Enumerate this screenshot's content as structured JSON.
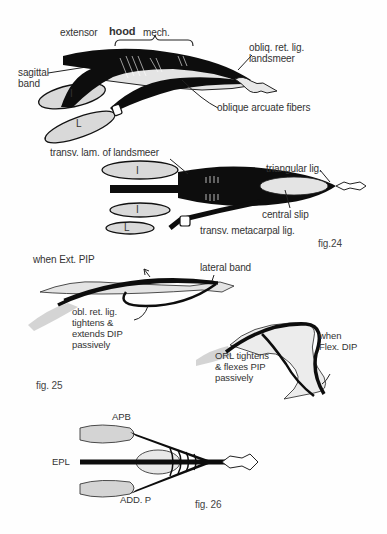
{
  "figures": [
    {
      "id": "fig24",
      "caption": "fig.24",
      "views": [
        {
          "view": "lateral",
          "labels": {
            "extensor_prefix": "extensor",
            "hood": "hood",
            "mech": "mech.",
            "sagittal_band": "sagittal\nband",
            "obliq_ret_lig": "obliq. ret. lig.\nlandsmeer",
            "oblique_arcuate": "oblique arcuate fibers",
            "interosseous": "I",
            "lumbrical": "L"
          }
        },
        {
          "view": "dorsal",
          "labels": {
            "transv_lam": "transv. lam. of landsmeer",
            "triangular_lig": "triangular lig.",
            "central_slip": "central slip",
            "transv_metacarpal": "transv. metacarpal lig.",
            "interosseous_top": "I",
            "interosseous_bottom": "I",
            "lumbrical": "L"
          }
        }
      ]
    },
    {
      "id": "fig25",
      "caption": "fig. 25",
      "labels": {
        "when_ext_pip": "when Ext. PIP",
        "lateral_band": "lateral band",
        "obl_ret_lig": "obl. ret. lig.\ntightens &\nextends DIP\npassively",
        "when_flex_dip": "when\nFlex. DIP",
        "orl_tightens": "ORL tightens\n& flexes PIP\npassively"
      }
    },
    {
      "id": "fig26",
      "caption": "fig. 26",
      "labels": {
        "apb": "APB",
        "epl": "EPL",
        "add_p": "ADD. P"
      }
    }
  ],
  "colors": {
    "ink": "#0d0d0d",
    "muscle_fill": "#d9d9d9",
    "bone_fill": "#e6e6e6",
    "text": "#333333"
  }
}
